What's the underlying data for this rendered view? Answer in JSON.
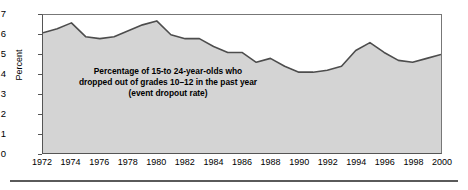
{
  "chart_data": {
    "type": "area",
    "title": "",
    "subtitle": "",
    "xlabel": "",
    "ylabel": "Percent",
    "ylim": [
      0,
      7
    ],
    "xlim": [
      1972,
      2000
    ],
    "grid": false,
    "legend_position": "none",
    "y_ticks": [
      "0",
      "1",
      "2",
      "3",
      "4",
      "5",
      "6",
      "7"
    ],
    "y_tick_values": [
      0,
      1,
      2,
      3,
      4,
      5,
      6,
      7
    ],
    "x_ticks": [
      "1972",
      "1974",
      "1976",
      "1978",
      "1980",
      "1982",
      "1984",
      "1986",
      "1988",
      "1990",
      "1992",
      "1994",
      "1996",
      "1998",
      "2000"
    ],
    "x_tick_values": [
      1972,
      1974,
      1976,
      1978,
      1980,
      1982,
      1984,
      1986,
      1988,
      1990,
      1992,
      1994,
      1996,
      1998,
      2000
    ],
    "annotations": [
      {
        "name": "event-dropout-rate-note",
        "lines": [
          "Percentage of 15-to 24-year-olds who",
          "dropped out of grades 10–12 in the past year",
          "(event dropout rate)"
        ]
      }
    ],
    "series": [
      {
        "name": "Event dropout rate",
        "fill_color": "#d4d4d4",
        "line_color": "#4d4d4d",
        "x": [
          1972,
          1973,
          1974,
          1975,
          1976,
          1977,
          1978,
          1979,
          1980,
          1981,
          1982,
          1983,
          1984,
          1985,
          1986,
          1987,
          1988,
          1989,
          1990,
          1991,
          1992,
          1993,
          1994,
          1995,
          1996,
          1997,
          1998,
          1999,
          2000
        ],
        "values": [
          6.1,
          6.3,
          6.6,
          5.9,
          5.8,
          5.9,
          6.2,
          6.5,
          6.7,
          6.0,
          5.8,
          5.8,
          5.4,
          5.1,
          5.1,
          4.6,
          4.8,
          4.4,
          4.1,
          4.1,
          4.2,
          4.4,
          5.2,
          5.6,
          5.1,
          4.7,
          4.6,
          4.8,
          5.0
        ]
      }
    ]
  }
}
